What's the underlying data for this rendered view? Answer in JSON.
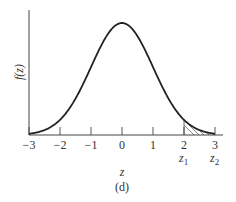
{
  "chart_data": {
    "type": "line",
    "title": "",
    "caption": "(d)",
    "xlabel": "z",
    "ylabel": "f(z)",
    "xlim": [
      -3,
      3
    ],
    "x_ticks": [
      -3,
      -2,
      -1,
      0,
      1,
      2,
      3
    ],
    "x_tick_labels": [
      "−3",
      "−2",
      "−1",
      "0",
      "1",
      "2",
      "3"
    ],
    "series": [
      {
        "name": "standard normal density",
        "x": [
          -3,
          -2.5,
          -2,
          -1.5,
          -1,
          -0.5,
          0,
          0.5,
          1,
          1.5,
          2,
          2.5,
          3
        ],
        "values": [
          0.0044,
          0.0175,
          0.054,
          0.1295,
          0.242,
          0.352,
          0.3989,
          0.352,
          0.242,
          0.1295,
          0.054,
          0.0175,
          0.0044
        ]
      }
    ],
    "shaded_region": {
      "from": 2,
      "to": 3,
      "pattern": "hatched",
      "labels": [
        "z1",
        "z2"
      ]
    },
    "annotations": [
      {
        "text": "z",
        "sub": "1",
        "x": 2
      },
      {
        "text": "z",
        "sub": "2",
        "x": 3
      }
    ],
    "grid": false,
    "legend": "none"
  },
  "labels": {
    "ylabel": "f(z)",
    "xlabel": "z",
    "caption": "(d)",
    "z1_main": "z",
    "z1_sub": "1",
    "z2_main": "z",
    "z2_sub": "2"
  },
  "colors": {
    "curve": "#222222",
    "axis": "#444444",
    "text": "#333333"
  }
}
